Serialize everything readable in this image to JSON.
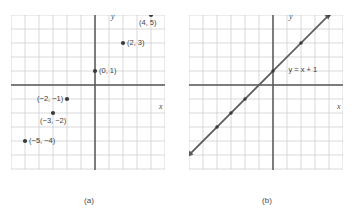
{
  "figure": {
    "panels": [
      {
        "caption": "(a)",
        "axis_x_label": "x",
        "axis_y_label": "y",
        "points": [
          {
            "label": "(4, 5)",
            "x": 4,
            "y": 5,
            "label_side": "below-right"
          },
          {
            "label": "(2, 3)",
            "x": 2,
            "y": 3,
            "label_side": "right"
          },
          {
            "label": "(0, 1)",
            "x": 0,
            "y": 1,
            "label_side": "right"
          },
          {
            "label": "(−2, −1)",
            "x": -2,
            "y": -1,
            "label_side": "left"
          },
          {
            "label": "(−3, −2)",
            "x": -3,
            "y": -2,
            "label_side": "below"
          },
          {
            "label": "(−5, −4)",
            "x": -5,
            "y": -4,
            "label_side": "right"
          }
        ]
      },
      {
        "caption": "(b)",
        "axis_x_label": "x",
        "axis_y_label": "y",
        "equation_label": "y = x + 1",
        "line": {
          "slope": 1,
          "intercept": 1
        },
        "line_points": [
          {
            "x": -4,
            "y": -3
          },
          {
            "x": -3,
            "y": -2
          },
          {
            "x": -2,
            "y": -1
          },
          {
            "x": 0,
            "y": 1
          },
          {
            "x": 2,
            "y": 3
          },
          {
            "x": 4,
            "y": 5
          }
        ]
      }
    ],
    "grid": {
      "x_min": -6,
      "x_max": 5,
      "y_min": -6,
      "y_max": 5,
      "cell_px": 14
    },
    "colors": {
      "grid": "#c9c9c9",
      "axis": "#575757",
      "point": "#3a3a3a",
      "line": "#5a5a5a",
      "text": "#3d3d3d"
    }
  }
}
